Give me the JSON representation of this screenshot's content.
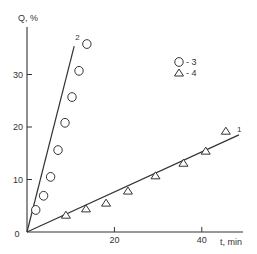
{
  "chart_data": {
    "type": "scatter",
    "title": "",
    "xlabel": "t, min",
    "ylabel": "Q, %",
    "xlim": [
      0,
      48
    ],
    "ylim": [
      0,
      39
    ],
    "x_ticks": [
      0,
      20,
      40
    ],
    "y_ticks": [
      0,
      10,
      20,
      30
    ],
    "x_tick_labels": [
      "0",
      "20",
      "40"
    ],
    "y_tick_labels": [
      "0",
      "10",
      "20",
      "30"
    ],
    "origin_label": "0",
    "grid": false,
    "legend": [
      {
        "marker": "circle",
        "label": "- 3"
      },
      {
        "marker": "triangle",
        "label": "- 4"
      }
    ],
    "legend_position": "upper-center",
    "series": [
      {
        "name": "3",
        "marker": "circle",
        "points": [
          {
            "x": 2.0,
            "y": 4.2
          },
          {
            "x": 3.8,
            "y": 6.9
          },
          {
            "x": 5.4,
            "y": 10.5
          },
          {
            "x": 7.1,
            "y": 15.6
          },
          {
            "x": 8.7,
            "y": 20.8
          },
          {
            "x": 10.3,
            "y": 25.7
          },
          {
            "x": 11.9,
            "y": 30.7
          },
          {
            "x": 13.7,
            "y": 35.8
          }
        ]
      },
      {
        "name": "4",
        "marker": "triangle",
        "points": [
          {
            "x": 8.9,
            "y": 3.2
          },
          {
            "x": 13.5,
            "y": 4.4
          },
          {
            "x": 18.1,
            "y": 5.5
          },
          {
            "x": 23.1,
            "y": 7.8
          },
          {
            "x": 29.4,
            "y": 10.7
          },
          {
            "x": 35.8,
            "y": 13.1
          },
          {
            "x": 40.9,
            "y": 15.4
          },
          {
            "x": 45.5,
            "y": 19.2
          }
        ]
      }
    ],
    "fit_lines": [
      {
        "label": "1",
        "from": {
          "x": 0,
          "y": 0
        },
        "to": {
          "x": 48.5,
          "y": 18.5
        }
      },
      {
        "label": "2",
        "from": {
          "x": 0,
          "y": 0
        },
        "to": {
          "x": 10.8,
          "y": 35.4
        }
      }
    ]
  }
}
